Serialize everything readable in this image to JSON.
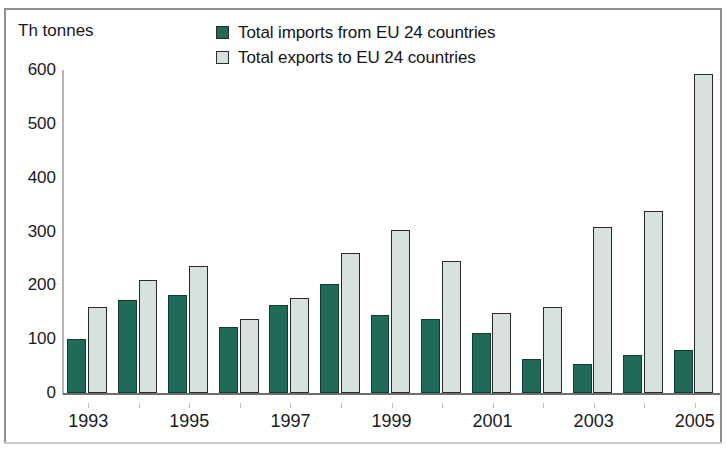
{
  "axis_unit": "Th tonnes",
  "legend": {
    "position": "top",
    "items": [
      {
        "label": "Total imports from EU 24 countries",
        "color": "#1f6b58",
        "key": "imports"
      },
      {
        "label": "Total exports to EU 24 countries",
        "color": "#d7e2de",
        "key": "exports"
      }
    ]
  },
  "chart_data": {
    "type": "bar",
    "title": "",
    "subtitle": "",
    "xlabel": "",
    "ylabel": "Th tonnes",
    "ylim": [
      0,
      600
    ],
    "yticks": [
      0,
      100,
      200,
      300,
      400,
      500,
      600
    ],
    "ytick_labels": [
      "0",
      "100",
      "200",
      "300",
      "400",
      "500",
      "600"
    ],
    "grid": false,
    "legend_position": "top",
    "categories": [
      1993,
      1994,
      1995,
      1996,
      1997,
      1998,
      1999,
      2000,
      2001,
      2002,
      2003,
      2004,
      2005
    ],
    "xtick_labels": [
      "1993",
      "",
      "1995",
      "",
      "1997",
      "",
      "1999",
      "",
      "2001",
      "",
      "2003",
      "",
      "2005"
    ],
    "series": [
      {
        "name": "Total imports from EU 24 countries",
        "color": "#1f6b58",
        "values": [
          100,
          172,
          183,
          123,
          164,
          202,
          145,
          138,
          111,
          64,
          53,
          71,
          79
        ]
      },
      {
        "name": "Total exports to EU 24 countries",
        "color": "#d7e2de",
        "values": [
          160,
          210,
          236,
          137,
          176,
          260,
          302,
          245,
          149,
          159,
          309,
          338,
          593
        ]
      }
    ]
  }
}
